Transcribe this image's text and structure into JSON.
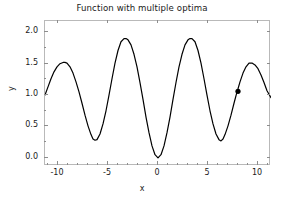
{
  "chart_data": {
    "type": "line",
    "title": "Function with multiple optima",
    "xlabel": "x",
    "ylabel": "y",
    "xlim": [
      -11.3,
      11.3
    ],
    "ylim": [
      -0.13,
      2.18
    ],
    "grid": false,
    "legend": null,
    "xticks": [
      -10,
      -5,
      0,
      5,
      10
    ],
    "xticklabels": [
      "-10",
      "-5",
      "0",
      "5",
      "10"
    ],
    "xminorticks": [
      -11,
      -9,
      -8,
      -7,
      -6,
      -4,
      -3,
      -2,
      -1,
      1,
      2,
      3,
      4,
      6,
      7,
      8,
      9,
      11
    ],
    "yticks": [
      0.0,
      0.5,
      1.0,
      1.5,
      2.0
    ],
    "yticklabels": [
      "0.0",
      "0.5",
      "1.0",
      "1.5",
      "2.0"
    ],
    "yminorticks": [
      0.25,
      0.75,
      1.25,
      1.75
    ],
    "line_color": "#000000",
    "line_width": 1.2,
    "frame_color": "#b9b9b9",
    "background": "#ffffff",
    "series": [
      {
        "name": "f(x)",
        "x": [
          -11.3,
          -11.0,
          -10.7,
          -10.4,
          -10.1,
          -9.8,
          -9.5,
          -9.3,
          -9.1,
          -8.8,
          -8.5,
          -8.2,
          -7.9,
          -7.6,
          -7.3,
          -7.0,
          -6.7,
          -6.5,
          -6.3,
          -6.1,
          -5.8,
          -5.5,
          -5.2,
          -4.9,
          -4.6,
          -4.3,
          -4.0,
          -3.7,
          -3.4,
          -3.2,
          -3.0,
          -2.7,
          -2.4,
          -2.1,
          -1.8,
          -1.5,
          -1.2,
          -0.9,
          -0.6,
          -0.3,
          0.0,
          0.3,
          0.6,
          0.9,
          1.2,
          1.5,
          1.8,
          2.1,
          2.4,
          2.7,
          3.0,
          3.2,
          3.4,
          3.7,
          4.0,
          4.3,
          4.6,
          4.9,
          5.2,
          5.5,
          5.8,
          6.1,
          6.3,
          6.5,
          6.7,
          7.0,
          7.3,
          7.6,
          7.9,
          8.0,
          8.2,
          8.5,
          8.8,
          9.1,
          9.4,
          9.7,
          10.0,
          10.3,
          10.6,
          10.9,
          11.3
        ],
        "y": [
          1.0,
          1.13,
          1.26,
          1.37,
          1.45,
          1.5,
          1.52,
          1.52,
          1.51,
          1.45,
          1.35,
          1.21,
          1.05,
          0.87,
          0.68,
          0.51,
          0.37,
          0.3,
          0.28,
          0.29,
          0.38,
          0.54,
          0.75,
          1.0,
          1.26,
          1.51,
          1.71,
          1.85,
          1.9,
          1.9,
          1.88,
          1.8,
          1.65,
          1.45,
          1.2,
          0.93,
          0.65,
          0.4,
          0.19,
          0.05,
          0.0,
          0.05,
          0.19,
          0.4,
          0.65,
          0.93,
          1.2,
          1.45,
          1.65,
          1.8,
          1.88,
          1.9,
          1.9,
          1.85,
          1.71,
          1.51,
          1.26,
          1.0,
          0.75,
          0.54,
          0.38,
          0.29,
          0.27,
          0.3,
          0.37,
          0.51,
          0.68,
          0.87,
          1.05,
          1.1,
          1.21,
          1.35,
          1.45,
          1.51,
          1.51,
          1.48,
          1.42,
          1.32,
          1.2,
          1.07,
          0.96
        ]
      }
    ],
    "markers": [
      {
        "name": "selected-point",
        "x": 8.0,
        "y": 1.06,
        "color": "#000000",
        "size": 5.2,
        "shape": "circle"
      }
    ]
  }
}
